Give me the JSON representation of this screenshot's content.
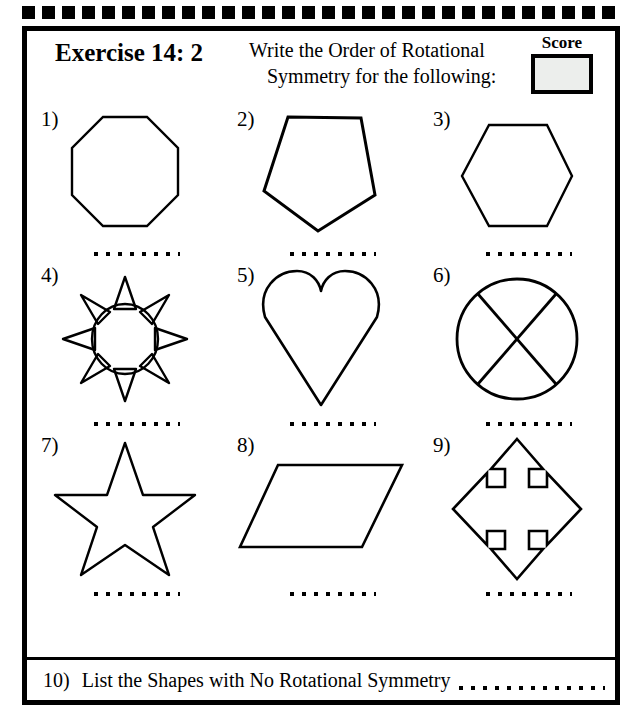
{
  "worksheet": {
    "title": "Exercise 14: 2",
    "prompt_line1": "Write the Order of Rotational",
    "prompt_line2": "Symmetry for the following:",
    "score_label": "Score",
    "score_value": "",
    "border_color": "#000000",
    "score_fill_color": "#eceeec",
    "answer_line": "............"
  },
  "questions": [
    {
      "num": "1)",
      "shape": "octagon",
      "answer": "",
      "answer_line": "............"
    },
    {
      "num": "2)",
      "shape": "pentagon",
      "answer": "",
      "answer_line": "............"
    },
    {
      "num": "3)",
      "shape": "hexagon",
      "answer": "",
      "answer_line": "............"
    },
    {
      "num": "4)",
      "shape": "sun",
      "answer": "",
      "answer_line": "............"
    },
    {
      "num": "5)",
      "shape": "heart",
      "answer": "",
      "answer_line": "............"
    },
    {
      "num": "6)",
      "shape": "circle-with-cross",
      "answer": "",
      "answer_line": "............"
    },
    {
      "num": "7)",
      "shape": "five-pointed-star",
      "answer": "",
      "answer_line": "............"
    },
    {
      "num": "8)",
      "shape": "parallelogram",
      "answer": "",
      "answer_line": "............"
    },
    {
      "num": "9)",
      "shape": "four-way-arrow",
      "answer": "",
      "answer_line": "............"
    }
  ],
  "question10": {
    "num": "10)",
    "text": "List the Shapes with No Rotational Symmetry",
    "answer": "",
    "answer_line": "................"
  }
}
